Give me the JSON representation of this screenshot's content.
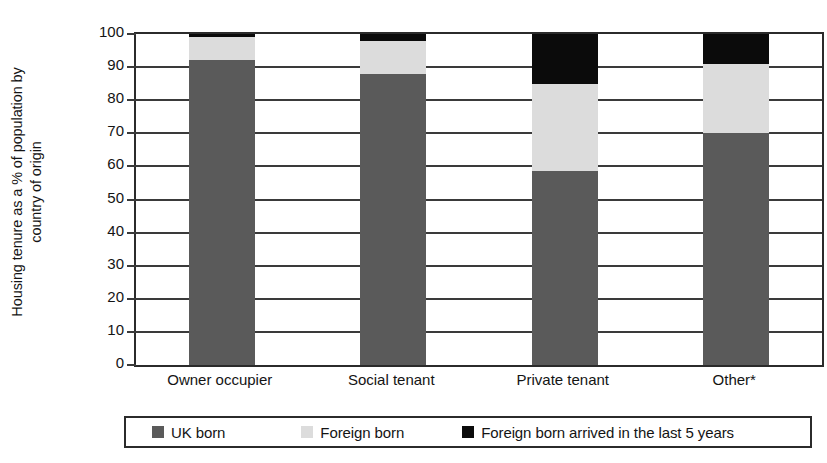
{
  "chart_data": {
    "type": "bar",
    "subtype": "stacked-vertical-100",
    "title": "",
    "xlabel": "",
    "ylabel": "Housing tenure as a % of population by country of origin",
    "ylabel_line1": "Housing tenure as a % of population by",
    "ylabel_line2": "country of origin",
    "ylim": [
      0,
      100
    ],
    "ytick_labels": [
      "100",
      "90",
      "80",
      "70",
      "60",
      "50",
      "40",
      "30",
      "20",
      "10",
      "0"
    ],
    "ytick_values": [
      100,
      90,
      80,
      70,
      60,
      50,
      40,
      30,
      20,
      10,
      0
    ],
    "grid": true,
    "grid_axis": "y",
    "legend_position": "bottom",
    "categories": [
      "Owner occupier",
      "Social tenant",
      "Private tenant",
      "Other*"
    ],
    "series": [
      {
        "name": "UK born",
        "color": "#5a5a5a",
        "values": [
          92,
          88,
          58.5,
          70
        ]
      },
      {
        "name": "Foreign born",
        "color": "#dcdcdc",
        "values": [
          7,
          10,
          26.5,
          21
        ]
      },
      {
        "name": "Foreign born arrived in the last 5 years",
        "color": "#0b0b0b",
        "values": [
          1,
          2,
          15,
          9
        ]
      }
    ],
    "footnote": "*"
  },
  "axis": {
    "y_title_line1": "Housing tenure as a % of population by",
    "y_title_line2": "country of origin"
  },
  "legend": {
    "items": [
      {
        "label": "UK born",
        "color": "#5a5a5a"
      },
      {
        "label": "Foreign born",
        "color": "#dcdcdc"
      },
      {
        "label": "Foreign born arrived in the last 5 years",
        "color": "#0b0b0b"
      }
    ]
  },
  "colors": {
    "uk_born": "#5a5a5a",
    "foreign_born": "#dcdcdc",
    "foreign_born_recent": "#0b0b0b",
    "axis": "#2b2b2b",
    "background": "#ffffff"
  }
}
